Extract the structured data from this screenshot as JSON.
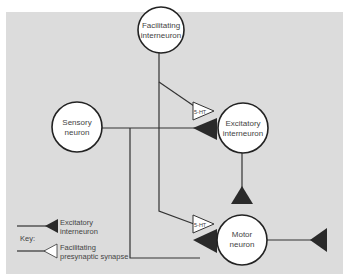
{
  "diagram": {
    "panel_color": "#dcdcdc",
    "line_color": "#333333",
    "excitatory_color": "#2a2a2a",
    "facilitating_color": "#ffffff",
    "neurons": [
      {
        "id": "facilitating",
        "line1": "Facilitating",
        "line2": "interneuron"
      },
      {
        "id": "sensory",
        "line1": "Sensory",
        "line2": "neuron"
      },
      {
        "id": "excitatory",
        "line1": "Excitatory",
        "line2": "interneuron"
      },
      {
        "id": "motor",
        "line1": "Motor",
        "line2": "neuron"
      }
    ],
    "synapse_labels": {
      "upper": "5-HT",
      "lower": "5-HT"
    },
    "key": {
      "title": "Key:",
      "excitatory_line1": "Excitatory",
      "excitatory_line2": "interneuron",
      "facilitating_line1": "Facilitating",
      "facilitating_line2": "presynaptic synapse"
    }
  }
}
